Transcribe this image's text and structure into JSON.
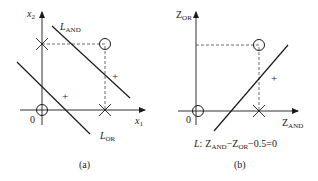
{
  "panel_a": {
    "y_axis_label": "x",
    "y_axis_sub": "2",
    "x_axis_label": "x",
    "x_axis_sub": "1",
    "origin_label": "0",
    "line_and_label": "L",
    "line_and_sub": "AND",
    "line_or_label": "L",
    "line_or_sub": "OR",
    "plus_1": "+",
    "plus_2": "+",
    "caption": "(a)"
  },
  "panel_b": {
    "y_axis_label": "Z",
    "y_axis_sub": "OR",
    "x_axis_label": "Z",
    "x_axis_sub": "AND",
    "origin_label": "0",
    "plus": "+",
    "equation_L": "L",
    "equation_colon": ":",
    "equation_z1": "Z",
    "equation_z1_sub": "AND",
    "equation_minus1": "−",
    "equation_z2": "Z",
    "equation_z2_sub": "OR",
    "equation_rest": "−0.5=0",
    "caption": "(b)"
  },
  "colors": {
    "line": "#1a1a1a",
    "axis": "#1a1a1a",
    "dashed": "#444444",
    "background": "#ffffff"
  }
}
